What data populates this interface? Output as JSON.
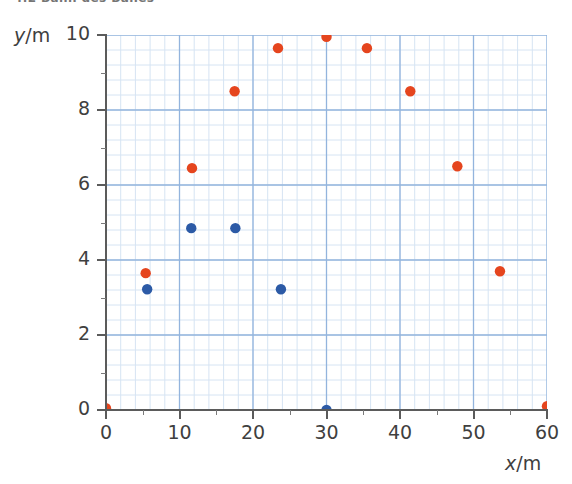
{
  "caption": {
    "text": "4.2 Bahn des Balles"
  },
  "axes": {
    "x": {
      "title_symbol": "x",
      "title_sep": "/",
      "title_unit": "m",
      "title": "x/m",
      "ticks": [
        0,
        10,
        20,
        30,
        40,
        50,
        60
      ],
      "tick_labels": [
        "0",
        "10",
        "20",
        "30",
        "40",
        "50",
        "60"
      ],
      "min": 0,
      "max": 60,
      "minor_step": 2
    },
    "y": {
      "title_symbol": "y",
      "title_sep": "/",
      "title_unit": "m",
      "title": "y/m",
      "ticks": [
        0,
        2,
        4,
        6,
        8,
        10
      ],
      "tick_labels": [
        "0",
        "2",
        "4",
        "6",
        "8",
        "10"
      ],
      "min": 0,
      "max": 10,
      "minor_step": 0.4
    }
  },
  "colors": {
    "orange": "#E5451E",
    "blue": "#2C5AA6",
    "grid_major": "#93b4dd",
    "grid_minor": "#d6e4f3",
    "axis": "#5b5b5b",
    "text": "#3f3f3f",
    "background": "#ffffff"
  },
  "chart_data": {
    "type": "scatter",
    "title": "4.2 Bahn des Balles",
    "xlabel": "x/m",
    "ylabel": "y/m",
    "xlim": [
      0,
      60
    ],
    "ylim": [
      0,
      10
    ],
    "grid": true,
    "legend": "none",
    "series": [
      {
        "name": "orange-trajectory",
        "color": "#E5451E",
        "marker": "circle",
        "points": [
          {
            "x": 0.0,
            "y": 0.05
          },
          {
            "x": 5.4,
            "y": 3.65
          },
          {
            "x": 11.7,
            "y": 6.45
          },
          {
            "x": 17.5,
            "y": 8.5
          },
          {
            "x": 23.4,
            "y": 9.65
          },
          {
            "x": 30.0,
            "y": 9.95
          },
          {
            "x": 35.5,
            "y": 9.65
          },
          {
            "x": 41.4,
            "y": 8.5
          },
          {
            "x": 47.8,
            "y": 6.5
          },
          {
            "x": 53.6,
            "y": 3.7
          },
          {
            "x": 60.0,
            "y": 0.1
          }
        ]
      },
      {
        "name": "blue-trajectory",
        "color": "#2C5AA6",
        "marker": "circle",
        "points": [
          {
            "x": 5.6,
            "y": 3.22
          },
          {
            "x": 11.6,
            "y": 4.85
          },
          {
            "x": 17.6,
            "y": 4.85
          },
          {
            "x": 23.8,
            "y": 3.22
          },
          {
            "x": 30.0,
            "y": 0.0
          }
        ]
      }
    ]
  }
}
